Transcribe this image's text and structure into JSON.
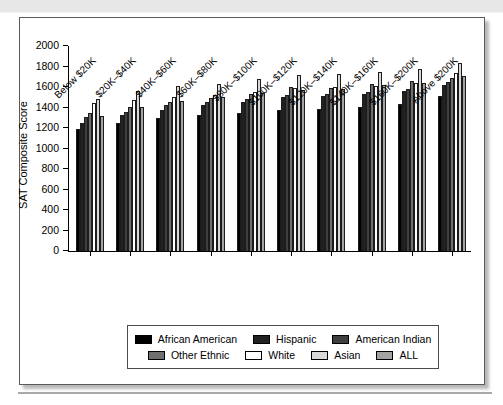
{
  "figure": {
    "ylabel": "SAT Composite Score"
  },
  "chart_data": {
    "type": "bar",
    "title": "",
    "xlabel": "",
    "ylabel": "SAT Composite Score",
    "ylim": [
      0,
      2000
    ],
    "ytick_step": 200,
    "grid": false,
    "legend_position": "bottom-boxed",
    "categories": [
      "Below $20K",
      "$20K–$40K",
      "$40K–$60K",
      "$60K–$80K",
      "$80K–$100K",
      "$100K–$120K",
      "$120K–$140K",
      "$140K–$160K",
      "$160K–$200K",
      "Above $200K"
    ],
    "series": [
      {
        "name": "African American",
        "color": "#000000",
        "values": [
          1190,
          1250,
          1300,
          1330,
          1350,
          1380,
          1390,
          1400,
          1430,
          1510
        ]
      },
      {
        "name": "Hispanic",
        "color": "#222222",
        "values": [
          1250,
          1330,
          1380,
          1420,
          1450,
          1500,
          1510,
          1530,
          1560,
          1620
        ]
      },
      {
        "name": "American Indian",
        "color": "#3f3f3f",
        "values": [
          1310,
          1360,
          1420,
          1450,
          1480,
          1520,
          1530,
          1550,
          1580,
          1650
        ]
      },
      {
        "name": "Other Ethnic",
        "color": "#6f6f6f",
        "values": [
          1350,
          1400,
          1450,
          1490,
          1530,
          1600,
          1590,
          1630,
          1660,
          1690
        ]
      },
      {
        "name": "White",
        "color": "#ffffff",
        "values": [
          1440,
          1470,
          1500,
          1520,
          1550,
          1590,
          1600,
          1610,
          1640,
          1740
        ]
      },
      {
        "name": "Asian",
        "color": "#d8d8d8",
        "values": [
          1480,
          1560,
          1610,
          1630,
          1680,
          1720,
          1730,
          1750,
          1780,
          1830
        ]
      },
      {
        "name": "ALL",
        "color": "#a3a3a3",
        "values": [
          1320,
          1400,
          1460,
          1500,
          1540,
          1570,
          1580,
          1620,
          1640,
          1710
        ]
      }
    ]
  }
}
